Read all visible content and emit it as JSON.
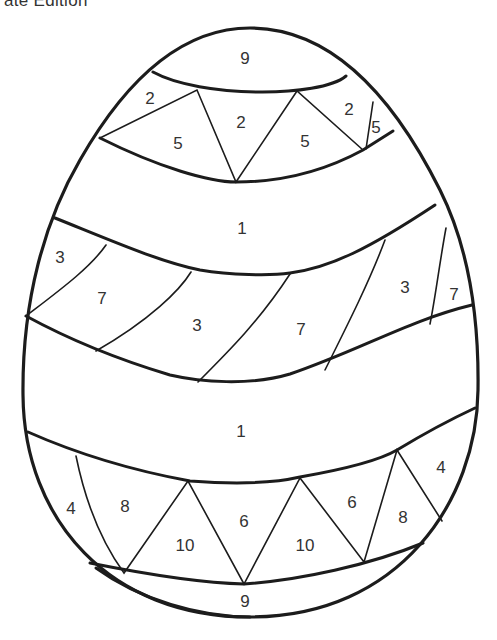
{
  "caption": "ate Edition",
  "page": {
    "regions": [
      {
        "id": "top-cap",
        "number": "9",
        "x": 245,
        "y": 58
      },
      {
        "id": "top-tri-1",
        "number": "2",
        "x": 150,
        "y": 98
      },
      {
        "id": "top-tri-2",
        "number": "5",
        "x": 178,
        "y": 143
      },
      {
        "id": "top-tri-3",
        "number": "2",
        "x": 241,
        "y": 122
      },
      {
        "id": "top-tri-4",
        "number": "5",
        "x": 305,
        "y": 141
      },
      {
        "id": "top-tri-5",
        "number": "2",
        "x": 349,
        "y": 109
      },
      {
        "id": "top-tri-6",
        "number": "5",
        "x": 376,
        "y": 127
      },
      {
        "id": "band-1-upper",
        "number": "1",
        "x": 242,
        "y": 228
      },
      {
        "id": "stripe-1",
        "number": "3",
        "x": 60,
        "y": 257
      },
      {
        "id": "stripe-2",
        "number": "7",
        "x": 102,
        "y": 298
      },
      {
        "id": "stripe-3",
        "number": "3",
        "x": 197,
        "y": 325
      },
      {
        "id": "stripe-4",
        "number": "7",
        "x": 301,
        "y": 329
      },
      {
        "id": "stripe-5",
        "number": "3",
        "x": 405,
        "y": 287
      },
      {
        "id": "stripe-6",
        "number": "7",
        "x": 454,
        "y": 294
      },
      {
        "id": "band-1-lower",
        "number": "1",
        "x": 241,
        "y": 431
      },
      {
        "id": "bot-tri-1",
        "number": "4",
        "x": 71,
        "y": 508
      },
      {
        "id": "bot-tri-2",
        "number": "8",
        "x": 125,
        "y": 506
      },
      {
        "id": "bot-tri-3",
        "number": "10",
        "x": 185,
        "y": 545
      },
      {
        "id": "bot-tri-4",
        "number": "6",
        "x": 244,
        "y": 521
      },
      {
        "id": "bot-tri-5",
        "number": "10",
        "x": 305,
        "y": 545
      },
      {
        "id": "bot-tri-6",
        "number": "6",
        "x": 352,
        "y": 502
      },
      {
        "id": "bot-tri-7",
        "number": "8",
        "x": 403,
        "y": 517
      },
      {
        "id": "bot-tri-8",
        "number": "4",
        "x": 441,
        "y": 467
      },
      {
        "id": "bottom-cap",
        "number": "9",
        "x": 245,
        "y": 601
      }
    ]
  }
}
